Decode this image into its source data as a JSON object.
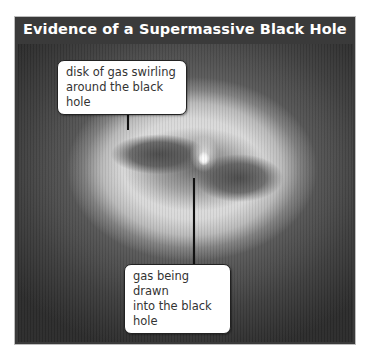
{
  "figure": {
    "title": "Evidence of a Supermassive Black Hole",
    "image_description": "grayscale telescope image of a glowing disk of gas around a central bright point",
    "callouts": [
      {
        "id": "disk",
        "lines": [
          "disk of gas swirling",
          "around the black hole"
        ]
      },
      {
        "id": "core",
        "lines": [
          "gas being drawn",
          "into the black hole"
        ]
      }
    ],
    "colors": {
      "title_bar": "#3a3a3a",
      "title_text": "#ffffff",
      "callout_bg": "#ffffff",
      "callout_border": "#222222"
    }
  }
}
